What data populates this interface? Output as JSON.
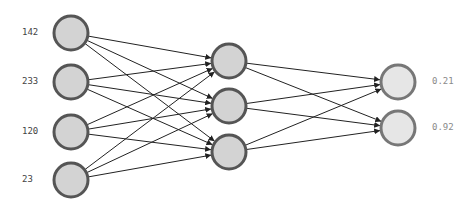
{
  "diagram": {
    "type": "neural-network",
    "colors": {
      "edge": "#222222",
      "input_fill": "#d3d3d3",
      "hidden_fill": "#d3d3d3",
      "output_fill": "#e6e6e6",
      "node_stroke": "#555555",
      "output_stroke": "#777777"
    },
    "layers": [
      {
        "name": "input",
        "x": 71,
        "nodes": [
          {
            "y": 33,
            "label": "142"
          },
          {
            "y": 82,
            "label": "233"
          },
          {
            "y": 132,
            "label": "120"
          },
          {
            "y": 180,
            "label": "23"
          }
        ]
      },
      {
        "name": "hidden",
        "x": 229,
        "nodes": [
          {
            "y": 61
          },
          {
            "y": 106
          },
          {
            "y": 152
          }
        ]
      },
      {
        "name": "output",
        "x": 398,
        "nodes": [
          {
            "y": 82,
            "label": "0.21"
          },
          {
            "y": 128,
            "label": "0.92"
          }
        ]
      }
    ],
    "node_radius": 17
  },
  "labels": {
    "inputs": [
      "142",
      "233",
      "120",
      "23"
    ],
    "outputs": [
      "0.21",
      "0.92"
    ]
  }
}
